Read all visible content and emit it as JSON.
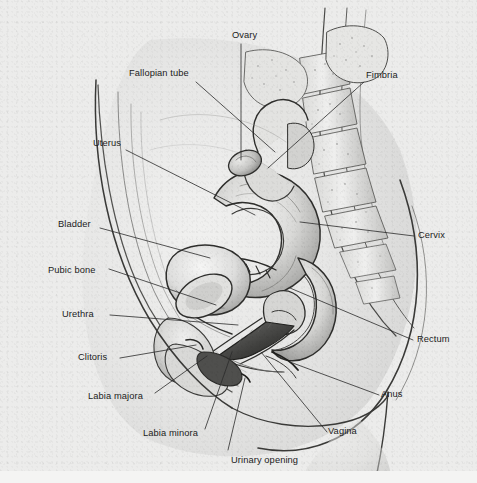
{
  "figure": {
    "kind": "anatomical-illustration",
    "style": "grayscale pencil drawing",
    "background_color": "#ececeb",
    "label_color": "#1b1b1b",
    "leader_line_color": "#2b2b2b"
  },
  "labels": [
    {
      "id": "ovary",
      "text": "Ovary",
      "x": 232,
      "y": 30,
      "align": "left"
    },
    {
      "id": "fimbria",
      "text": "Fimbria",
      "x": 366,
      "y": 70,
      "align": "left"
    },
    {
      "id": "fallopian-tube",
      "text": "Fallopian tube",
      "x": 129,
      "y": 68,
      "align": "left"
    },
    {
      "id": "uterus",
      "text": "Uterus",
      "x": 93,
      "y": 138,
      "align": "left"
    },
    {
      "id": "bladder",
      "text": "Bladder",
      "x": 58,
      "y": 219,
      "align": "left"
    },
    {
      "id": "cervix",
      "text": "Cervix",
      "x": 418,
      "y": 230,
      "align": "left"
    },
    {
      "id": "pubic-bone",
      "text": "Pubic bone",
      "x": 48,
      "y": 265,
      "align": "left"
    },
    {
      "id": "urethra",
      "text": "Urethra",
      "x": 62,
      "y": 309,
      "align": "left"
    },
    {
      "id": "rectum",
      "text": "Rectum",
      "x": 417,
      "y": 334,
      "align": "left"
    },
    {
      "id": "clitoris",
      "text": "Clitoris",
      "x": 78,
      "y": 352,
      "align": "left"
    },
    {
      "id": "anus",
      "text": "Anus",
      "x": 381,
      "y": 389,
      "align": "left"
    },
    {
      "id": "labia-majora",
      "text": "Labia majora",
      "x": 88,
      "y": 391,
      "align": "left"
    },
    {
      "id": "vagina",
      "text": "Vagina",
      "x": 328,
      "y": 426,
      "align": "left"
    },
    {
      "id": "labia-minora",
      "text": "Labia minora",
      "x": 143,
      "y": 428,
      "align": "left"
    },
    {
      "id": "urinary-opening",
      "text": "Urinary opening",
      "x": 231,
      "y": 455,
      "align": "left"
    }
  ],
  "leader_lines": [
    {
      "id": "ovary-leader",
      "points": "241,44 241,160"
    },
    {
      "id": "fimbria-leader",
      "points": "364,82 268,168"
    },
    {
      "id": "fallopian-tube-leader",
      "points": "196,82 275,152"
    },
    {
      "id": "uterus-leader",
      "points": "126,150 255,215"
    },
    {
      "id": "bladder-leader",
      "points": "100,228 210,258"
    },
    {
      "id": "cervix-leader",
      "points": "414,236 300,222"
    },
    {
      "id": "pubic-bone-leader",
      "points": "109,269 216,305"
    },
    {
      "id": "urethra-leader",
      "points": "110,315 238,325"
    },
    {
      "id": "rectum-leader",
      "points": "413,340 290,288"
    },
    {
      "id": "clitoris-leader",
      "points": "120,358 196,345"
    },
    {
      "id": "anus-leader",
      "points": "379,395 290,362"
    },
    {
      "id": "labia-majora-leader",
      "points": "155,393 207,356"
    },
    {
      "id": "vagina-leader",
      "points": "327,432 261,352"
    },
    {
      "id": "labia-minora-leader",
      "points": "205,429 232,352"
    },
    {
      "id": "urinary-opening-leader",
      "points": "228,450 245,378"
    }
  ]
}
